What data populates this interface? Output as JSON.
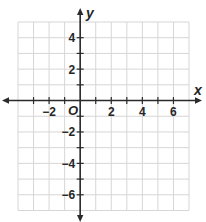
{
  "chart_data": {
    "type": "scatter",
    "title": "",
    "xlabel": "x",
    "ylabel": "y",
    "origin_label": "O",
    "xlim": [
      -4,
      7
    ],
    "ylim": [
      -7,
      5
    ],
    "grid": true,
    "grid_step": 1,
    "x_ticks": [
      -3,
      -2,
      -1,
      1,
      2,
      3,
      4,
      5,
      6
    ],
    "x_tick_labels": [
      {
        "value": -2,
        "text": "−2"
      },
      {
        "value": 2,
        "text": "2"
      },
      {
        "value": 4,
        "text": "4"
      },
      {
        "value": 6,
        "text": "6"
      }
    ],
    "y_ticks": [
      4,
      3,
      2,
      1,
      -1,
      -2,
      -3,
      -4,
      -5,
      -6
    ],
    "y_tick_labels": [
      {
        "value": 4,
        "text": "4"
      },
      {
        "value": 2,
        "text": "2"
      },
      {
        "value": -2,
        "text": "−2"
      },
      {
        "value": -4,
        "text": "−4"
      },
      {
        "value": -6,
        "text": "−6"
      }
    ],
    "series": [],
    "legend": null
  },
  "colors": {
    "axis": "#2b2b2b",
    "grid": "#d6d6d6",
    "text": "#262626",
    "background": "#ffffff"
  }
}
